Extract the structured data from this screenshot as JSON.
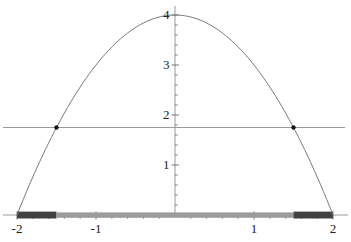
{
  "figure": {
    "background_color": "#ffffff"
  },
  "chart_data": {
    "type": "line",
    "title": "",
    "xlabel": "",
    "ylabel": "",
    "grid": false,
    "legend": null,
    "function": {
      "expression": "y = 4 - x^2",
      "coefficients": {
        "a": -1,
        "b": 0,
        "c": 4
      },
      "domain": [
        -2,
        2
      ]
    },
    "horizontal_line": {
      "y": 1.75
    },
    "marked_points": [
      {
        "x": -1.5,
        "y": 1.75
      },
      {
        "x": 1.5,
        "y": 1.75
      }
    ],
    "x_axis": {
      "min": -2.18,
      "max": 2.19,
      "ticks": [
        {
          "value": -2,
          "label": "-2"
        },
        {
          "value": -1,
          "label": "-1"
        },
        {
          "value": 1,
          "label": "1"
        },
        {
          "value": 2,
          "label": "2"
        }
      ],
      "minor_tick_step": 0.2
    },
    "y_axis": {
      "min": 0,
      "max": 4.18,
      "ticks": [
        {
          "value": 1,
          "label": "1"
        },
        {
          "value": 2,
          "label": "2"
        },
        {
          "value": 3,
          "label": "3"
        },
        {
          "value": 4,
          "label": "4"
        }
      ],
      "minor_tick_step": 0.2
    },
    "highlight_segments": [
      {
        "from": -2,
        "to": -1.5,
        "color": "#414141",
        "style": "thick-dark"
      },
      {
        "from": -1.5,
        "to": 1.5,
        "color": "#9b9b9b",
        "style": "thick-gray"
      },
      {
        "from": 1.5,
        "to": 2,
        "color": "#414141",
        "style": "thick-dark"
      }
    ],
    "colors": {
      "curve": "#7a7a7a",
      "horizontal_line": "#8f8f8f",
      "axis": "#8f8f8f",
      "tick": "#555555",
      "point": "#161616",
      "tick_label": "#222222"
    }
  }
}
